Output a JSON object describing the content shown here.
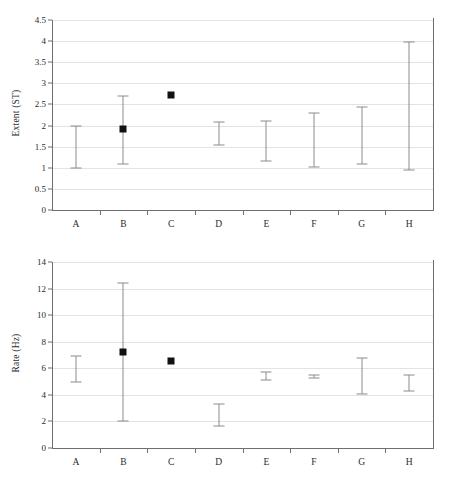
{
  "figure": {
    "panels": [
      "extent",
      "rate"
    ]
  },
  "chart_data": [
    {
      "type": "scatter",
      "title": "",
      "xlabel": "",
      "ylabel": "Extent (ST)",
      "categories": [
        "A",
        "B",
        "C",
        "D",
        "E",
        "F",
        "G",
        "H"
      ],
      "ylim": [
        0,
        4.5
      ],
      "yticks": [
        "0",
        "0.5",
        "1",
        "1.5",
        "2",
        "2.5",
        "3",
        "3.5",
        "4",
        "4.5"
      ],
      "ytick_values": [
        0,
        0.5,
        1,
        1.5,
        2,
        2.5,
        3,
        3.5,
        4,
        4.5
      ],
      "grid": true,
      "legend": "none",
      "series": [
        {
          "name": "Extent (ST)",
          "points": [
            {
              "category": "A",
              "value": null,
              "low": 1.0,
              "high": 2.0,
              "marker": false
            },
            {
              "category": "B",
              "value": 1.92,
              "low": 1.08,
              "high": 2.7,
              "marker": true
            },
            {
              "category": "C",
              "value": 2.73,
              "low": null,
              "high": null,
              "marker": true
            },
            {
              "category": "D",
              "value": null,
              "low": 1.55,
              "high": 2.09,
              "marker": false
            },
            {
              "category": "E",
              "value": null,
              "low": 1.16,
              "high": 2.1,
              "marker": false
            },
            {
              "category": "F",
              "value": null,
              "low": 1.01,
              "high": 2.3,
              "marker": false
            },
            {
              "category": "G",
              "value": null,
              "low": 1.1,
              "high": 2.44,
              "marker": false
            },
            {
              "category": "H",
              "value": null,
              "low": 0.94,
              "high": 3.99,
              "marker": false
            }
          ]
        }
      ]
    },
    {
      "type": "scatter",
      "title": "",
      "xlabel": "",
      "ylabel": "Rate (Hz)",
      "categories": [
        "A",
        "B",
        "C",
        "D",
        "E",
        "F",
        "G",
        "H"
      ],
      "ylim": [
        0,
        14
      ],
      "yticks": [
        "0",
        "2",
        "4",
        "6",
        "8",
        "10",
        "12",
        "14"
      ],
      "ytick_values": [
        0,
        2,
        4,
        6,
        8,
        10,
        12,
        14
      ],
      "grid": true,
      "legend": "none",
      "series": [
        {
          "name": "Rate (Hz)",
          "points": [
            {
              "category": "A",
              "value": null,
              "low": 5.0,
              "high": 6.9,
              "marker": false
            },
            {
              "category": "B",
              "value": 7.2,
              "low": 2.02,
              "high": 12.45,
              "marker": true
            },
            {
              "category": "C",
              "value": 6.55,
              "low": null,
              "high": null,
              "marker": true
            },
            {
              "category": "D",
              "value": null,
              "low": 1.62,
              "high": 3.32,
              "marker": false
            },
            {
              "category": "E",
              "value": null,
              "low": 5.1,
              "high": 5.7,
              "marker": false
            },
            {
              "category": "F",
              "value": null,
              "low": 5.25,
              "high": 5.5,
              "marker": false
            },
            {
              "category": "G",
              "value": null,
              "low": 4.05,
              "high": 6.75,
              "marker": false
            },
            {
              "category": "H",
              "value": null,
              "low": 4.3,
              "high": 5.5,
              "marker": false
            }
          ]
        }
      ]
    }
  ],
  "colors": {
    "marker": "#111111",
    "errorbar": "#8c8c8c",
    "grid": "#e3e3e3",
    "axis": "#6e6e6e",
    "text": "#2b2b2b",
    "background": "#ffffff"
  }
}
